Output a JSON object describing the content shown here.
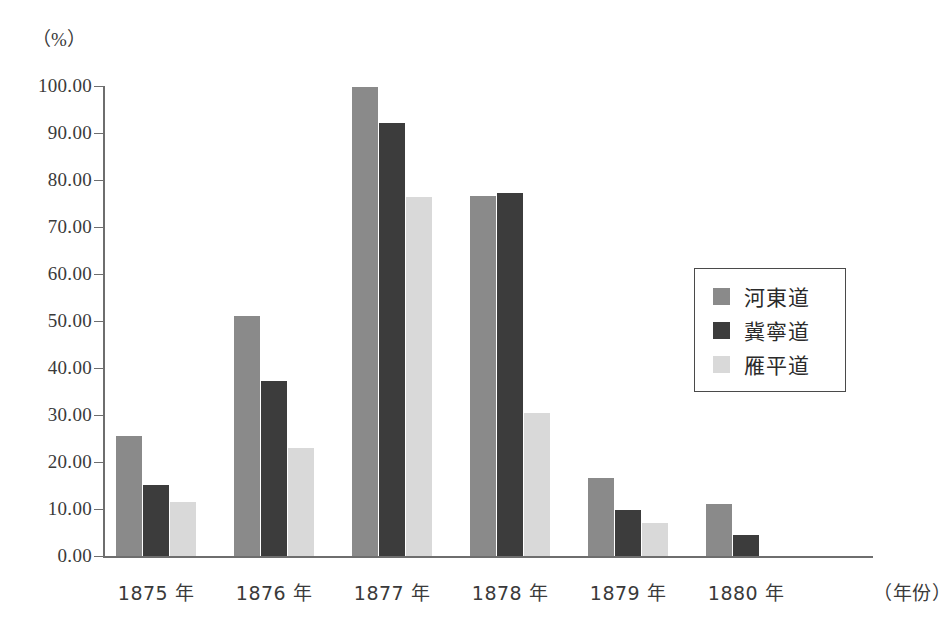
{
  "chart_data": {
    "type": "bar",
    "title": "",
    "xlabel": "（年份）",
    "ylabel": "（%）",
    "categories": [
      "1875 年",
      "1876 年",
      "1877 年",
      "1878 年",
      "1879 年",
      "1880 年"
    ],
    "series": [
      {
        "name": "河東道",
        "color": "#8a8a8a",
        "values": [
          25.6,
          51.1,
          99.8,
          76.5,
          16.7,
          11.1
        ]
      },
      {
        "name": "冀寧道",
        "color": "#3c3c3c",
        "values": [
          15.2,
          37.2,
          92.2,
          77.3,
          9.8,
          4.5
        ]
      },
      {
        "name": "雁平道",
        "color": "#d9d9d9",
        "values": [
          11.5,
          22.9,
          76.3,
          30.5,
          7.1,
          0.0
        ]
      }
    ],
    "ylim": [
      0,
      100
    ],
    "yticks": [
      "0.00",
      "10.00",
      "20.00",
      "30.00",
      "40.00",
      "50.00",
      "60.00",
      "70.00",
      "80.00",
      "90.00",
      "100.00"
    ],
    "ytick_values": [
      0,
      10,
      20,
      30,
      40,
      50,
      60,
      70,
      80,
      90,
      100
    ],
    "grid": false,
    "legend_position": "right-middle"
  },
  "axes": {
    "y_unit_label": "（%）",
    "x_axis_title": "（年份）"
  }
}
